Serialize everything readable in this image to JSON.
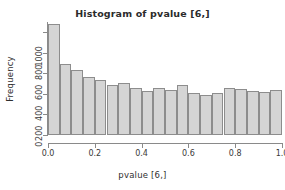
{
  "chart_data": {
    "type": "bar",
    "title": "Histogram of pvalue [6,]",
    "xlabel": "pvalue [6,]",
    "ylabel": "Frequency",
    "xlim": [
      0.0,
      1.0
    ],
    "ylim": [
      0,
      1100
    ],
    "grid": false,
    "legend": null,
    "bin_width": 0.05,
    "x_ticks": [
      "0.0",
      "0.2",
      "0.4",
      "0.6",
      "0.8",
      "1.0"
    ],
    "x_tick_values": [
      0.0,
      0.2,
      0.4,
      0.6,
      0.8,
      1.0
    ],
    "y_ticks": [
      "0",
      "200",
      "400",
      "600",
      "800",
      "1000"
    ],
    "y_tick_values": [
      0,
      200,
      400,
      600,
      800,
      1000
    ],
    "bin_starts": [
      0.0,
      0.05,
      0.1,
      0.15,
      0.2,
      0.25,
      0.3,
      0.35,
      0.4,
      0.45,
      0.5,
      0.55,
      0.6,
      0.65,
      0.7,
      0.75,
      0.8,
      0.85,
      0.9,
      0.95
    ],
    "bin_ends": [
      0.05,
      0.1,
      0.15,
      0.2,
      0.25,
      0.3,
      0.35,
      0.4,
      0.45,
      0.5,
      0.55,
      0.6,
      0.65,
      0.7,
      0.75,
      0.8,
      0.85,
      0.9,
      0.95,
      1.0
    ],
    "categories": [
      "0.00-0.05",
      "0.05-0.10",
      "0.10-0.15",
      "0.15-0.20",
      "0.20-0.25",
      "0.25-0.30",
      "0.30-0.35",
      "0.35-0.40",
      "0.40-0.45",
      "0.45-0.50",
      "0.50-0.55",
      "0.55-0.60",
      "0.60-0.65",
      "0.65-0.70",
      "0.70-0.75",
      "0.75-0.80",
      "0.80-0.85",
      "0.85-0.90",
      "0.90-0.95",
      "0.95-1.00"
    ],
    "values": [
      1080,
      690,
      630,
      565,
      535,
      490,
      505,
      460,
      430,
      460,
      440,
      485,
      405,
      390,
      410,
      460,
      450,
      430,
      415,
      435
    ],
    "bar_fill_color": "#d5d5d5",
    "bar_border_color": "#8d8d8d",
    "axis_color": "#8a8a8a",
    "text_color": "#2f2f2f"
  }
}
